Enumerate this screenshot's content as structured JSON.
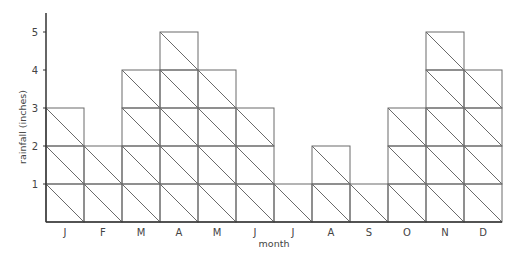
{
  "chart_data": {
    "type": "bar",
    "style": "stacked unit-square pictogram bars, each square split by a diagonal",
    "title": "",
    "xlabel": "month",
    "ylabel": "rainfall (inches)",
    "categories": [
      "J",
      "F",
      "M",
      "A",
      "M",
      "J",
      "J",
      "A",
      "S",
      "O",
      "N",
      "D"
    ],
    "values": [
      3,
      2,
      4,
      5,
      4,
      3,
      1,
      2,
      1,
      3,
      5,
      4
    ],
    "yticks": [
      1,
      2,
      3,
      4,
      5
    ],
    "ylim": [
      0,
      5.4
    ],
    "grid": false,
    "legend": null
  },
  "colors": {
    "axis": "#333333",
    "cell_stroke": "#6a6a6a",
    "text": "#444444"
  }
}
